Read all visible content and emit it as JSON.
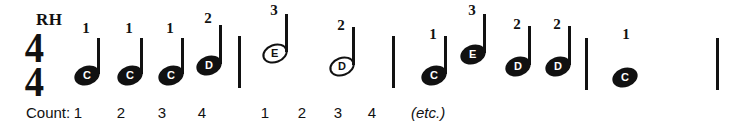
{
  "figure": {
    "hand_label": "RH",
    "time_signature": {
      "numerator": "4",
      "denominator": "4"
    },
    "ink_color": "#111111",
    "background_color": "#ffffff"
  },
  "notes": [
    {
      "letter": "C",
      "fingering": "1",
      "head": "filled",
      "stem": "up",
      "x": 74,
      "head_y": 66,
      "stem_h": 36,
      "fing_x": 78,
      "fing_y": 20
    },
    {
      "letter": "C",
      "fingering": "1",
      "head": "filled",
      "stem": "up",
      "x": 117,
      "head_y": 66,
      "stem_h": 36,
      "fing_x": 121,
      "fing_y": 20
    },
    {
      "letter": "C",
      "fingering": "1",
      "head": "filled",
      "stem": "up",
      "x": 158,
      "head_y": 66,
      "stem_h": 36,
      "fing_x": 162,
      "fing_y": 20
    },
    {
      "letter": "D",
      "fingering": "2",
      "head": "filled",
      "stem": "up",
      "x": 196,
      "head_y": 56,
      "stem_h": 39,
      "fing_x": 200,
      "fing_y": 10
    },
    {
      "letter": "E",
      "fingering": "3",
      "head": "hollow",
      "stem": "up",
      "x": 262,
      "head_y": 44,
      "stem_h": 38,
      "fing_x": 266,
      "fing_y": 2
    },
    {
      "letter": "D",
      "fingering": "2",
      "head": "hollow",
      "stem": "up",
      "x": 329,
      "head_y": 57,
      "stem_h": 38,
      "fing_x": 333,
      "fing_y": 17
    },
    {
      "letter": "C",
      "fingering": "1",
      "head": "filled",
      "stem": "up",
      "x": 421,
      "head_y": 66,
      "stem_h": 38,
      "fing_x": 425,
      "fing_y": 26
    },
    {
      "letter": "E",
      "fingering": "3",
      "head": "filled",
      "stem": "up",
      "x": 460,
      "head_y": 45,
      "stem_h": 39,
      "fing_x": 464,
      "fing_y": 2
    },
    {
      "letter": "D",
      "fingering": "2",
      "head": "filled",
      "stem": "up",
      "x": 505,
      "head_y": 57,
      "stem_h": 39,
      "fing_x": 509,
      "fing_y": 16
    },
    {
      "letter": "D",
      "fingering": "2",
      "head": "filled",
      "stem": "up",
      "x": 545,
      "head_y": 57,
      "stem_h": 39,
      "fing_x": 549,
      "fing_y": 16
    },
    {
      "letter": "C",
      "fingering": "1",
      "head": "filled",
      "stem": "none",
      "x": 612,
      "head_y": 68,
      "stem_h": 0,
      "fing_x": 618,
      "fing_y": 26
    }
  ],
  "barlines": [
    {
      "x": 238,
      "y": 36,
      "h": 52
    },
    {
      "x": 392,
      "y": 36,
      "h": 52
    },
    {
      "x": 585,
      "y": 38,
      "h": 52
    },
    {
      "x": 716,
      "y": 38,
      "h": 52
    }
  ],
  "counts": {
    "label": "Count:",
    "label_x": 26,
    "label_y": 104,
    "beats": [
      {
        "text": "1",
        "x": 70
      },
      {
        "text": "2",
        "x": 113
      },
      {
        "text": "3",
        "x": 154
      },
      {
        "text": "4",
        "x": 194
      },
      {
        "text": "1",
        "x": 257
      },
      {
        "text": "2",
        "x": 294
      },
      {
        "text": "3",
        "x": 330
      },
      {
        "text": "4",
        "x": 364
      }
    ],
    "beats_y": 104,
    "etc": {
      "text": "(etc.)",
      "x": 411,
      "y": 104
    }
  },
  "layout": {
    "hand_label_x": 36,
    "hand_label_y": 10,
    "time_sig_x": 24,
    "time_sig_y": 32
  }
}
